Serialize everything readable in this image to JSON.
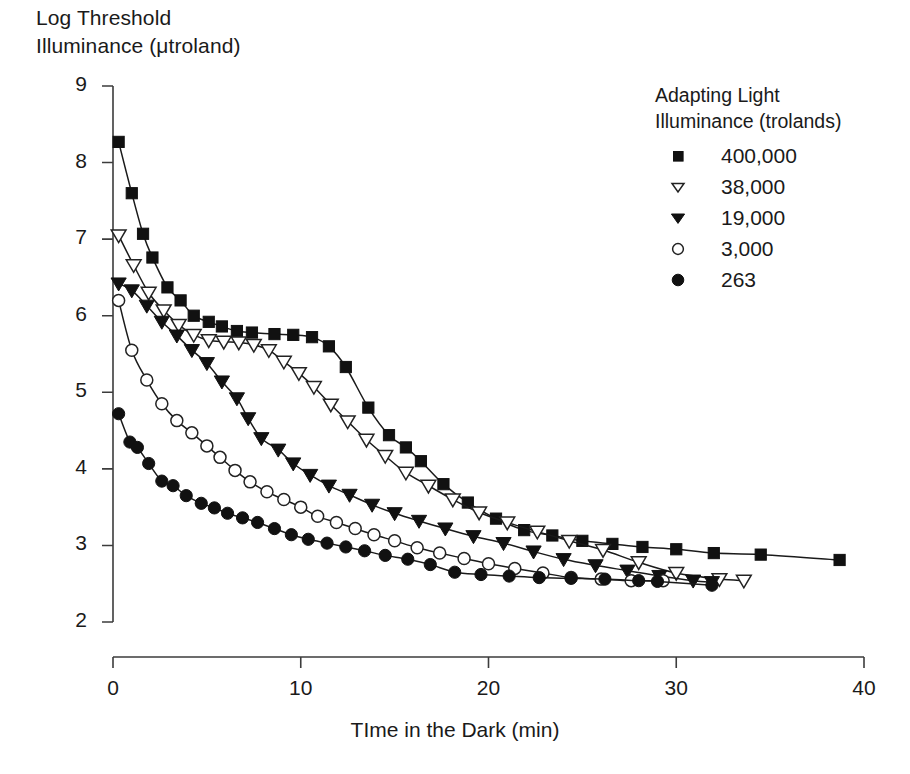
{
  "chart_data": {
    "type": "scatter",
    "title": "",
    "ylabel_lines": [
      "Log Threshold",
      "Illuminance (μtroland)"
    ],
    "ylabel": "Log Threshold Illuminance (μtroland)",
    "xlabel": "TIme in the Dark (min)",
    "xlim": [
      0,
      40
    ],
    "ylim": [
      2,
      9
    ],
    "xticks": [
      0,
      10,
      20,
      30,
      40
    ],
    "yticks": [
      2,
      3,
      4,
      5,
      6,
      7,
      8,
      9
    ],
    "grid": false,
    "legend_position": "upper-right",
    "legend_title_lines": [
      "Adapting Light",
      "Illuminance (trolands)"
    ],
    "legend_title": "Adapting Light Illuminance (trolands)",
    "series": [
      {
        "name": "400,000",
        "marker": "filled-square",
        "points": [
          [
            0.3,
            8.27
          ],
          [
            1.0,
            7.6
          ],
          [
            1.6,
            7.07
          ],
          [
            2.1,
            6.76
          ],
          [
            2.9,
            6.37
          ],
          [
            3.6,
            6.2
          ],
          [
            4.3,
            6.0
          ],
          [
            5.1,
            5.92
          ],
          [
            5.8,
            5.86
          ],
          [
            6.6,
            5.8
          ],
          [
            7.4,
            5.78
          ],
          [
            8.6,
            5.76
          ],
          [
            9.6,
            5.75
          ],
          [
            10.6,
            5.72
          ],
          [
            11.5,
            5.6
          ],
          [
            12.4,
            5.33
          ],
          [
            13.6,
            4.8
          ],
          [
            14.7,
            4.44
          ],
          [
            15.6,
            4.28
          ],
          [
            16.4,
            4.1
          ],
          [
            17.6,
            3.8
          ],
          [
            18.9,
            3.56
          ],
          [
            20.4,
            3.35
          ],
          [
            21.9,
            3.2
          ],
          [
            23.4,
            3.13
          ],
          [
            25.0,
            3.06
          ],
          [
            26.6,
            3.02
          ],
          [
            28.2,
            2.98
          ],
          [
            30.0,
            2.95
          ],
          [
            32.0,
            2.9
          ],
          [
            34.5,
            2.88
          ],
          [
            38.7,
            2.81
          ]
        ]
      },
      {
        "name": "38,000",
        "marker": "open-triangle-down",
        "points": [
          [
            0.3,
            7.05
          ],
          [
            1.1,
            6.66
          ],
          [
            1.9,
            6.3
          ],
          [
            2.7,
            6.07
          ],
          [
            3.5,
            5.88
          ],
          [
            4.3,
            5.75
          ],
          [
            5.1,
            5.68
          ],
          [
            5.9,
            5.66
          ],
          [
            6.7,
            5.65
          ],
          [
            7.5,
            5.62
          ],
          [
            8.3,
            5.55
          ],
          [
            9.1,
            5.4
          ],
          [
            9.9,
            5.25
          ],
          [
            10.7,
            5.07
          ],
          [
            11.6,
            4.84
          ],
          [
            12.5,
            4.62
          ],
          [
            13.5,
            4.38
          ],
          [
            14.5,
            4.17
          ],
          [
            15.6,
            3.95
          ],
          [
            16.8,
            3.78
          ],
          [
            18.1,
            3.6
          ],
          [
            19.5,
            3.43
          ],
          [
            21.0,
            3.3
          ],
          [
            22.6,
            3.18
          ],
          [
            24.3,
            3.06
          ],
          [
            26.1,
            2.94
          ],
          [
            28.0,
            2.78
          ],
          [
            30.0,
            2.64
          ],
          [
            32.3,
            2.56
          ],
          [
            33.6,
            2.54
          ]
        ]
      },
      {
        "name": "19,000",
        "marker": "filled-triangle-down",
        "points": [
          [
            0.3,
            6.42
          ],
          [
            1.0,
            6.33
          ],
          [
            1.8,
            6.13
          ],
          [
            2.6,
            5.92
          ],
          [
            3.4,
            5.74
          ],
          [
            4.2,
            5.55
          ],
          [
            5.0,
            5.38
          ],
          [
            5.8,
            5.14
          ],
          [
            6.6,
            4.92
          ],
          [
            7.2,
            4.66
          ],
          [
            7.9,
            4.4
          ],
          [
            8.8,
            4.25
          ],
          [
            9.6,
            4.07
          ],
          [
            10.5,
            3.92
          ],
          [
            11.5,
            3.78
          ],
          [
            12.6,
            3.66
          ],
          [
            13.8,
            3.53
          ],
          [
            15.0,
            3.42
          ],
          [
            16.3,
            3.32
          ],
          [
            17.7,
            3.22
          ],
          [
            19.2,
            3.12
          ],
          [
            20.8,
            3.03
          ],
          [
            22.4,
            2.92
          ],
          [
            24.0,
            2.82
          ],
          [
            25.7,
            2.74
          ],
          [
            27.4,
            2.67
          ],
          [
            29.1,
            2.6
          ],
          [
            30.9,
            2.54
          ],
          [
            31.9,
            2.52
          ]
        ]
      },
      {
        "name": "3,000",
        "marker": "open-circle",
        "points": [
          [
            0.3,
            6.2
          ],
          [
            1.0,
            5.55
          ],
          [
            1.8,
            5.16
          ],
          [
            2.6,
            4.85
          ],
          [
            3.4,
            4.63
          ],
          [
            4.2,
            4.47
          ],
          [
            5.0,
            4.3
          ],
          [
            5.7,
            4.15
          ],
          [
            6.5,
            3.98
          ],
          [
            7.3,
            3.83
          ],
          [
            8.2,
            3.7
          ],
          [
            9.1,
            3.6
          ],
          [
            10.0,
            3.5
          ],
          [
            10.9,
            3.38
          ],
          [
            11.9,
            3.3
          ],
          [
            12.9,
            3.22
          ],
          [
            13.9,
            3.14
          ],
          [
            15.0,
            3.06
          ],
          [
            16.2,
            2.97
          ],
          [
            17.4,
            2.9
          ],
          [
            18.7,
            2.83
          ],
          [
            20.0,
            2.76
          ],
          [
            21.4,
            2.7
          ],
          [
            22.9,
            2.64
          ],
          [
            24.4,
            2.58
          ],
          [
            26.0,
            2.56
          ],
          [
            27.6,
            2.54
          ],
          [
            29.3,
            2.54
          ]
        ]
      },
      {
        "name": "263",
        "marker": "filled-circle",
        "points": [
          [
            0.3,
            4.72
          ],
          [
            0.9,
            4.35
          ],
          [
            1.3,
            4.28
          ],
          [
            1.9,
            4.07
          ],
          [
            2.6,
            3.84
          ],
          [
            3.2,
            3.78
          ],
          [
            3.9,
            3.65
          ],
          [
            4.7,
            3.55
          ],
          [
            5.4,
            3.49
          ],
          [
            6.1,
            3.42
          ],
          [
            6.9,
            3.36
          ],
          [
            7.7,
            3.3
          ],
          [
            8.6,
            3.22
          ],
          [
            9.5,
            3.14
          ],
          [
            10.4,
            3.08
          ],
          [
            11.4,
            3.03
          ],
          [
            12.4,
            2.98
          ],
          [
            13.4,
            2.93
          ],
          [
            14.5,
            2.87
          ],
          [
            15.7,
            2.82
          ],
          [
            16.9,
            2.75
          ],
          [
            18.2,
            2.65
          ],
          [
            19.6,
            2.62
          ],
          [
            21.1,
            2.6
          ],
          [
            22.7,
            2.58
          ],
          [
            24.4,
            2.57
          ],
          [
            26.2,
            2.56
          ],
          [
            28.0,
            2.54
          ],
          [
            29.0,
            2.53
          ],
          [
            31.9,
            2.48
          ]
        ]
      }
    ]
  },
  "colors": {
    "axis": "#3c3c3c",
    "ink": "#1a1a1a",
    "marker_fill": "#111111",
    "marker_open_fill": "#ffffff",
    "background": "#ffffff"
  }
}
